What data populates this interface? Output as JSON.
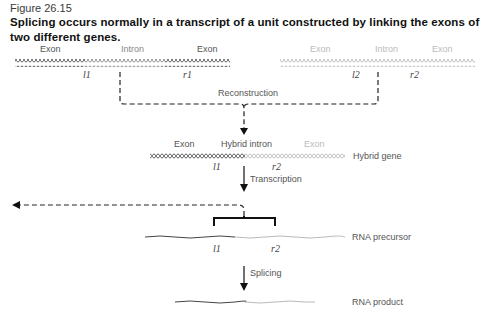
{
  "figure": {
    "number": "Figure 26.15",
    "caption": "Splicing occurs normally in a transcript of a unit constructed by linking the exons of two different genes."
  },
  "gene1": {
    "exon_left": "Exon",
    "intron": "Intron",
    "exon_right": "Exon",
    "left_site": "l1",
    "right_site": "r1"
  },
  "gene2": {
    "exon_left": "Exon",
    "intron": "Intron",
    "exon_right": "Exon",
    "left_site": "l2",
    "right_site": "r2"
  },
  "steps": {
    "reconstruction": "Reconstruction",
    "transcription": "Transcription",
    "splicing": "Splicing"
  },
  "hybrid": {
    "exon_left": "Exon",
    "intron": "Hybrid intron",
    "exon_right": "Exon",
    "label": "Hybrid gene",
    "left_site": "l1",
    "right_site": "r2"
  },
  "precursor": {
    "label": "RNA precursor",
    "left_site": "l1",
    "right_site": "r2"
  },
  "product": {
    "label": "RNA product"
  },
  "colors": {
    "gene1": "#555555",
    "gene2": "#bbbbbb",
    "arrow": "#111111"
  }
}
